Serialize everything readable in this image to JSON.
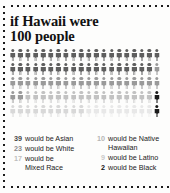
{
  "title": {
    "line1": "if Hawaii were",
    "line2": "100 people"
  },
  "chart_data": {
    "type": "pictogram",
    "title": "if Hawaii were 100 people",
    "total": 100,
    "rows": 5,
    "columns": 20,
    "unit_label": "person",
    "categories": [
      "Asian",
      "White",
      "Mixed Race",
      "Native Hawaiian",
      "Latino",
      "Black"
    ],
    "values": [
      39,
      23,
      17,
      10,
      9,
      2
    ],
    "colors": [
      "#5e5e5e",
      "#9a9a9a",
      "#c2c2c2",
      "#d8d8d8",
      "#e8e8e8",
      "#1b1b1b"
    ],
    "legend_position": "bottom",
    "grid": false
  },
  "legend": {
    "left": [
      {
        "num": "39",
        "text": "would be Asian",
        "cont": "",
        "color": "#4a4a4a"
      },
      {
        "num": "23",
        "text": "would be White",
        "cont": "",
        "color": "#8c8c8c"
      },
      {
        "num": "17",
        "text": "would be",
        "cont": "Mixed Race",
        "color": "#bdbdbd"
      }
    ],
    "right": [
      {
        "num": "10",
        "text": "would be Native",
        "cont": "Hawaiian",
        "color": "#b5b5b5"
      },
      {
        "num": "9",
        "text": "would be Latino",
        "cont": "",
        "color": "#c9c9c9"
      },
      {
        "num": "2",
        "text": "would be Black",
        "cont": "",
        "color": "#111111"
      }
    ]
  }
}
